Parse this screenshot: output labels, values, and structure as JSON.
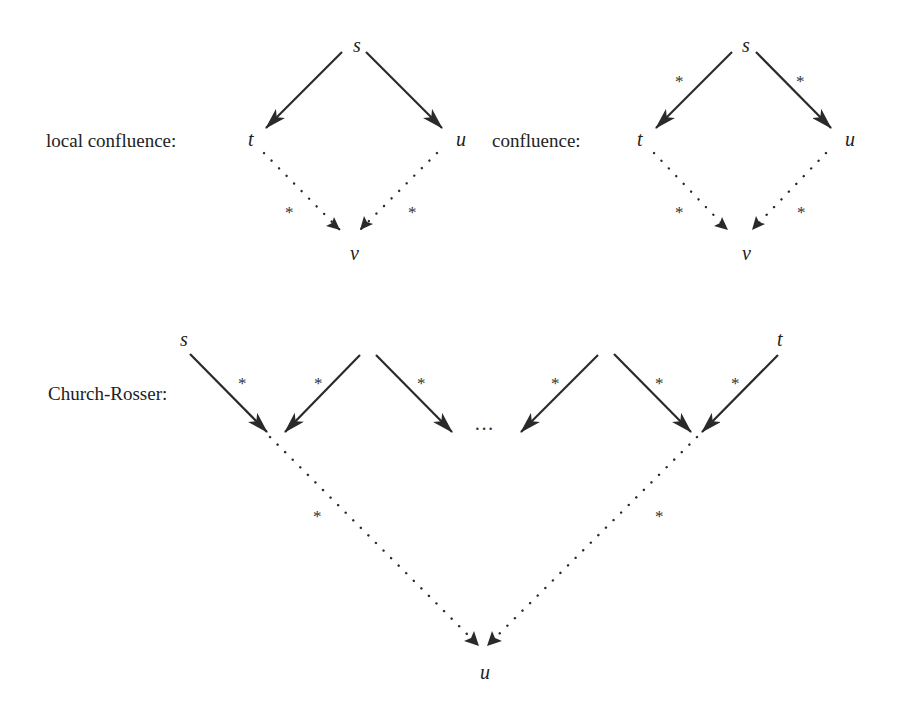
{
  "diagrams": {
    "local_confluence": {
      "title": "local confluence:",
      "nodes": {
        "s": "s",
        "t": "t",
        "u": "u",
        "v": "v"
      },
      "edges": [
        {
          "from": "s",
          "to": "t",
          "style": "solid",
          "label": ""
        },
        {
          "from": "s",
          "to": "u",
          "style": "solid",
          "label": ""
        },
        {
          "from": "t",
          "to": "v",
          "style": "dotted",
          "label": "*"
        },
        {
          "from": "u",
          "to": "v",
          "style": "dotted",
          "label": "*"
        }
      ]
    },
    "confluence": {
      "title": "confluence:",
      "nodes": {
        "s": "s",
        "t": "t",
        "u": "u",
        "v": "v"
      },
      "edges": [
        {
          "from": "s",
          "to": "t",
          "style": "solid",
          "label": "*"
        },
        {
          "from": "s",
          "to": "u",
          "style": "solid",
          "label": "*"
        },
        {
          "from": "t",
          "to": "v",
          "style": "dotted",
          "label": "*"
        },
        {
          "from": "u",
          "to": "v",
          "style": "dotted",
          "label": "*"
        }
      ]
    },
    "church_rosser": {
      "title": "Church-Rosser:",
      "nodes": {
        "s": "s",
        "t": "t",
        "u": "u"
      },
      "ellipsis": "···",
      "star": "*",
      "edges": [
        {
          "style": "solid",
          "label": "*",
          "description": "s to first join"
        },
        {
          "style": "solid",
          "label": "*",
          "description": "peak 1 to first join"
        },
        {
          "style": "solid",
          "label": "*",
          "description": "peak 1 to ellipsis"
        },
        {
          "style": "solid",
          "label": "*",
          "description": "peak 2 to ellipsis"
        },
        {
          "style": "solid",
          "label": "*",
          "description": "peak 2 to last join"
        },
        {
          "style": "solid",
          "label": "*",
          "description": "t to last join"
        },
        {
          "style": "dotted",
          "label": "*",
          "description": "first join to u"
        },
        {
          "style": "dotted",
          "label": "*",
          "description": "last join to u"
        }
      ]
    }
  },
  "star": "*"
}
